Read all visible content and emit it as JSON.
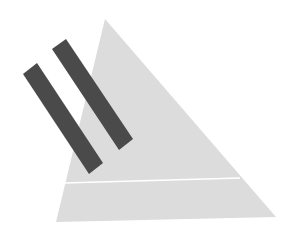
{
  "figure": {
    "width": 292,
    "height": 233,
    "background": "#ffffff",
    "triangle": {
      "points": "105,19 56,222 276,217",
      "fill": "#dcdcdc"
    },
    "divider_line": {
      "x1": 64,
      "y1": 183,
      "x2": 240,
      "y2": 178,
      "stroke": "#ffffff",
      "width": 1.5
    },
    "bars": [
      {
        "points": "23,74 37,63 103,163 89,174",
        "fill": "#4a4a4a"
      },
      {
        "points": "52,49 66,39 133,139 119,150",
        "fill": "#4a4a4a"
      }
    ]
  }
}
